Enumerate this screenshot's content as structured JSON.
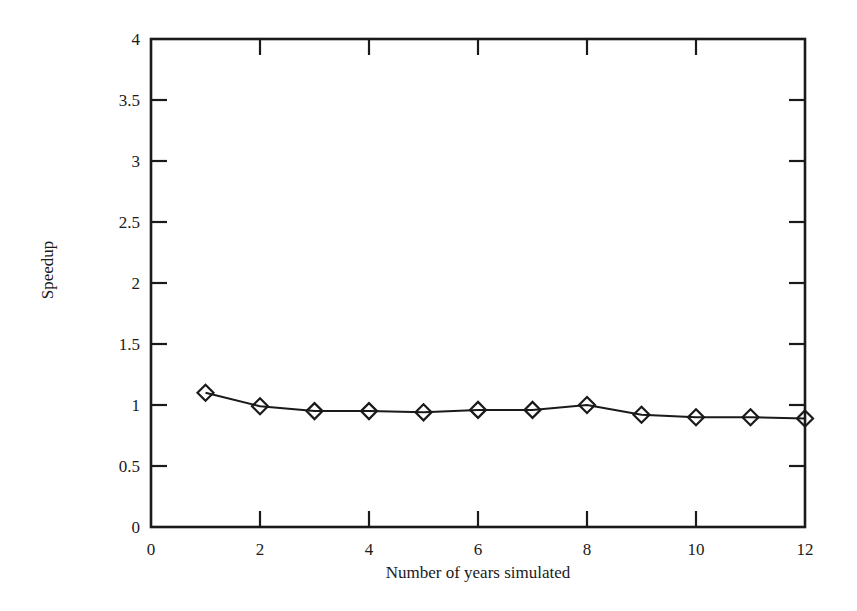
{
  "chart_data": {
    "type": "line",
    "title": "",
    "xlabel": "Number of years simulated",
    "ylabel": "Speedup",
    "xlim": [
      0,
      12
    ],
    "ylim": [
      0,
      4
    ],
    "grid": false,
    "legend": null,
    "x_ticks": [
      0,
      2,
      4,
      6,
      8,
      10,
      12
    ],
    "x_tick_labels": [
      "0",
      "2",
      "4",
      "6",
      "8",
      "10",
      "12"
    ],
    "y_ticks": [
      0,
      0.5,
      1,
      1.5,
      2,
      2.5,
      3,
      3.5,
      4
    ],
    "y_tick_labels": [
      "0",
      "0.5",
      "1",
      "1.5",
      "2",
      "2.5",
      "3",
      "3.5",
      "4"
    ],
    "series": [
      {
        "name": "Speedup",
        "marker": "diamond",
        "color": "#1a1a1a",
        "x": [
          1,
          2,
          3,
          4,
          5,
          6,
          7,
          8,
          9,
          10,
          11,
          12
        ],
        "values": [
          1.1,
          0.99,
          0.95,
          0.95,
          0.94,
          0.96,
          0.96,
          1.0,
          0.92,
          0.9,
          0.9,
          0.89
        ]
      }
    ]
  },
  "layout": {
    "plot_left": 151,
    "plot_right": 805,
    "plot_top": 39,
    "plot_bottom": 527,
    "ink_color": "#1a1a1a"
  }
}
